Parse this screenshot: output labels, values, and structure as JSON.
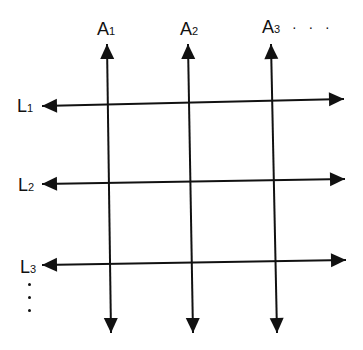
{
  "diagram": {
    "stroke_color": "#111111",
    "background": "#ffffff",
    "vertical_lines": [
      {
        "id": "A1",
        "letter": "A",
        "index": "1",
        "top": [
          107,
          44
        ],
        "bottom": [
          111,
          333
        ],
        "label_pos": [
          97,
          20
        ]
      },
      {
        "id": "A2",
        "letter": "A",
        "index": "2",
        "top": [
          188,
          44
        ],
        "bottom": [
          193,
          333
        ],
        "label_pos": [
          180,
          20
        ]
      },
      {
        "id": "A3",
        "letter": "A",
        "index": "3",
        "top": [
          271,
          44
        ],
        "bottom": [
          277,
          333
        ],
        "label_pos": [
          262,
          18
        ]
      }
    ],
    "horizontal_lines": [
      {
        "id": "L1",
        "letter": "L",
        "index": "1",
        "left": [
          42,
          106
        ],
        "right": [
          344,
          99
        ],
        "label_pos": [
          17,
          97
        ]
      },
      {
        "id": "L2",
        "letter": "L",
        "index": "2",
        "left": [
          42,
          184
        ],
        "right": [
          345,
          179
        ],
        "label_pos": [
          18,
          176
        ]
      },
      {
        "id": "L3",
        "letter": "L",
        "index": "3",
        "left": [
          42,
          265
        ],
        "right": [
          346,
          260
        ],
        "label_pos": [
          20,
          258
        ]
      }
    ],
    "continuation_horizontal": "· · ·",
    "continuation_vertical": "⋮"
  }
}
